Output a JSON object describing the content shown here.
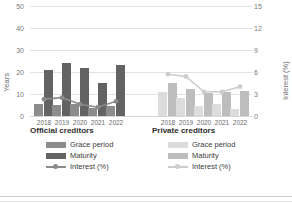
{
  "chart_data": {
    "type": "bar",
    "title": "",
    "categories": [
      "2018",
      "2019",
      "2020",
      "2021",
      "2022"
    ],
    "panels": [
      {
        "name": "Official creditors",
        "series": [
          {
            "name": "Grace period",
            "type": "bar",
            "axis": "left",
            "color": "#8c8c8c",
            "values": [
              5.5,
              5.0,
              5.5,
              3.5,
              4.5
            ]
          },
          {
            "name": "Maturity",
            "type": "bar",
            "axis": "left",
            "color": "#636363",
            "values": [
              21,
              24,
              22,
              15,
              23
            ]
          },
          {
            "name": "Interest (%)",
            "type": "line",
            "axis": "right",
            "color": "#8a8a8a",
            "values": [
              2.3,
              2.5,
              1.6,
              1.2,
              2.0
            ]
          }
        ]
      },
      {
        "name": "Private creditors",
        "series": [
          {
            "name": "Grace period",
            "type": "bar",
            "axis": "left",
            "color": "#dcdcdc",
            "values": [
              11.0,
              8.0,
              4.5,
              5.5,
              3.0
            ]
          },
          {
            "name": "Maturity",
            "type": "bar",
            "axis": "left",
            "color": "#bdbdbd",
            "values": [
              15.0,
              12.5,
              10.5,
              11.0,
              11.5
            ]
          },
          {
            "name": "Interest (%)",
            "type": "line",
            "axis": "right",
            "color": "#cccccc",
            "values": [
              5.7,
              5.4,
              3.3,
              3.3,
              4.0
            ]
          }
        ]
      }
    ],
    "left_axis": {
      "label": "Years",
      "ticks": [
        "0",
        "10",
        "20",
        "30",
        "40",
        "50"
      ],
      "ylim": [
        0,
        50
      ]
    },
    "right_axis": {
      "label": "Interest (%)",
      "ticks": [
        "0",
        "3",
        "6",
        "9",
        "12",
        "15"
      ],
      "ylim": [
        0,
        15
      ]
    },
    "xlabel": "",
    "grid": true,
    "legend_position": "bottom"
  },
  "legends": [
    {
      "title": "Official creditors",
      "items": [
        {
          "label": "Grace period",
          "marker": "swatch",
          "color": "#8c8c8c"
        },
        {
          "label": "Maturity",
          "marker": "swatch",
          "color": "#636363"
        },
        {
          "label": "Interest (%)",
          "marker": "line-dot",
          "color": "#8a8a8a"
        }
      ]
    },
    {
      "title": "Private creditors",
      "items": [
        {
          "label": "Grace period",
          "marker": "swatch",
          "color": "#dcdcdc"
        },
        {
          "label": "Maturity",
          "marker": "swatch",
          "color": "#bdbdbd"
        },
        {
          "label": "Interest (%)",
          "marker": "line-dot",
          "color": "#cccccc"
        }
      ]
    }
  ]
}
